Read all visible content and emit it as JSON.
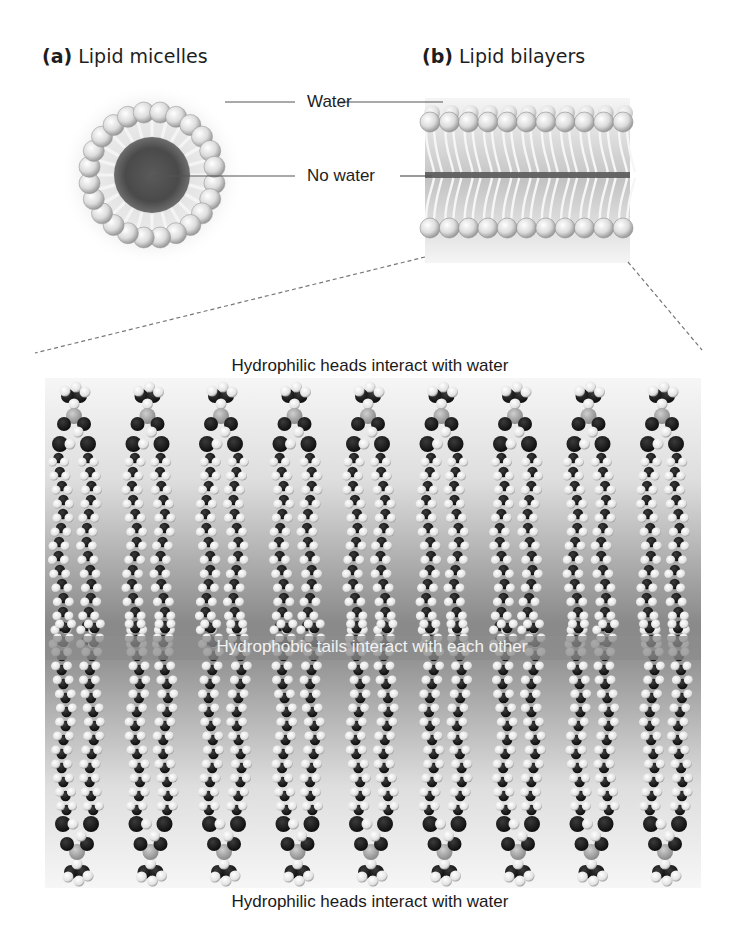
{
  "figure": {
    "panel_a": {
      "letter": "(a)",
      "title": "Lipid micelles"
    },
    "panel_b": {
      "letter": "(b)",
      "title": "Lipid bilayers"
    },
    "callouts": {
      "water": "Water",
      "no_water": "No water"
    },
    "molecular_view": {
      "top_caption": "Hydrophilic heads interact with water",
      "middle_caption": "Hydrophobic tails interact with each other",
      "bottom_caption": "Hydrophilic heads interact with water",
      "lipid_count_per_leaflet": 9
    },
    "colors": {
      "background": "#ffffff",
      "text": "#1e1e1e",
      "head_sphere": "#e6e6e6",
      "core_dark": "#4a4a4a",
      "band_gray": "#8c8c8c",
      "atom_dark": "#1c1c1c",
      "atom_light": "#f0f0f0"
    }
  }
}
